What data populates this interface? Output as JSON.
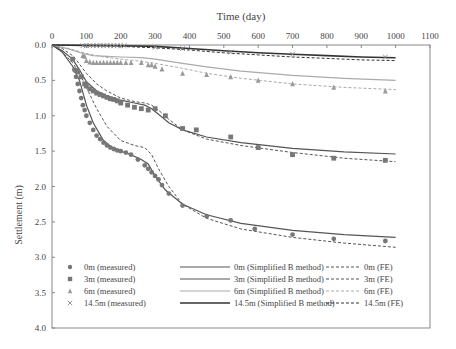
{
  "chart_data": {
    "type": "scatter",
    "title": "",
    "xlabel": "Time (day)",
    "ylabel": "Settlement (m)",
    "xlim": [
      0,
      1100
    ],
    "ylim": [
      0,
      4.0
    ],
    "y_inverted": true,
    "x_axis_position": "top",
    "xticks": [
      0,
      100,
      200,
      300,
      400,
      500,
      600,
      700,
      800,
      900,
      1000,
      1100
    ],
    "xtick_labels": [
      "0",
      "100",
      "200",
      "300",
      "400",
      "500",
      "600",
      "700",
      "800",
      "900",
      "1000",
      "1100"
    ],
    "yticks": [
      0,
      0.5,
      1.0,
      1.5,
      2.0,
      2.5,
      3.0,
      3.5,
      4.0
    ],
    "ytick_labels": [
      "0.0",
      "0.5",
      "1.0",
      "1.5",
      "2.0",
      "2.5",
      "3.0",
      "3.5",
      "4.0"
    ],
    "grid": false,
    "legend_position": "bottom",
    "series": [
      {
        "name": "0m (measured)",
        "kind": "marker",
        "marker": "circle",
        "color": "#777777",
        "x": [
          65,
          70,
          75,
          80,
          85,
          90,
          95,
          100,
          110,
          120,
          130,
          140,
          150,
          160,
          170,
          180,
          190,
          200,
          215,
          230,
          250,
          270,
          280,
          290,
          300,
          310,
          320,
          340,
          380,
          450,
          520,
          590,
          700,
          820,
          970
        ],
        "y": [
          0.35,
          0.45,
          0.55,
          0.65,
          0.75,
          0.85,
          0.92,
          1.0,
          1.1,
          1.2,
          1.28,
          1.33,
          1.38,
          1.42,
          1.45,
          1.47,
          1.49,
          1.5,
          1.52,
          1.55,
          1.62,
          1.7,
          1.75,
          1.8,
          1.85,
          1.9,
          1.98,
          2.1,
          2.27,
          2.42,
          2.48,
          2.6,
          2.68,
          2.74,
          2.77
        ]
      },
      {
        "name": "3m (measured)",
        "kind": "marker",
        "marker": "square",
        "color": "#777777",
        "x": [
          60,
          70,
          75,
          85,
          95,
          100,
          110,
          120,
          130,
          140,
          150,
          160,
          170,
          180,
          190,
          200,
          220,
          240,
          260,
          280,
          300,
          330,
          380,
          420,
          520,
          600,
          700,
          820,
          970
        ],
        "y": [
          0.2,
          0.36,
          0.38,
          0.45,
          0.55,
          0.58,
          0.62,
          0.65,
          0.68,
          0.7,
          0.72,
          0.74,
          0.76,
          0.77,
          0.79,
          0.82,
          0.85,
          0.88,
          0.9,
          0.92,
          0.9,
          1.0,
          1.18,
          1.2,
          1.3,
          1.45,
          1.55,
          1.6,
          1.63
        ]
      },
      {
        "name": "6m (measured)",
        "kind": "marker",
        "marker": "triangle",
        "color": "#999999",
        "x": [
          90,
          95,
          100,
          110,
          120,
          130,
          140,
          150,
          160,
          170,
          180,
          190,
          200,
          215,
          230,
          260,
          280,
          290,
          300,
          320,
          380,
          450,
          520,
          600,
          700,
          820,
          970
        ],
        "y": [
          0.15,
          0.16,
          0.22,
          0.24,
          0.25,
          0.25,
          0.25,
          0.25,
          0.25,
          0.25,
          0.25,
          0.25,
          0.25,
          0.25,
          0.25,
          0.25,
          0.28,
          0.28,
          0.3,
          0.34,
          0.4,
          0.42,
          0.45,
          0.5,
          0.55,
          0.6,
          0.65
        ]
      },
      {
        "name": "14.5m (measured)",
        "kind": "marker",
        "marker": "x",
        "color": "#888888",
        "x": [
          90,
          100,
          110,
          120,
          130,
          140,
          150,
          160,
          170,
          180,
          190,
          200,
          210,
          300,
          380,
          520,
          700,
          970
        ],
        "y": [
          0.01,
          0.01,
          0.01,
          0.01,
          0.01,
          0.01,
          0.01,
          0.01,
          0.01,
          0.01,
          0.01,
          0.01,
          0.01,
          0.03,
          0.05,
          0.1,
          0.13,
          0.17
        ]
      },
      {
        "name": "0m (Simplified B method)",
        "kind": "solid",
        "color": "#555555",
        "width": 1.2,
        "x": [
          0,
          30,
          60,
          80,
          100,
          120,
          150,
          180,
          200,
          230,
          260,
          280,
          300,
          330,
          380,
          450,
          550,
          700,
          850,
          1000
        ],
        "y": [
          0,
          0.1,
          0.3,
          0.5,
          0.85,
          1.1,
          1.35,
          1.47,
          1.5,
          1.55,
          1.62,
          1.68,
          1.85,
          2.05,
          2.25,
          2.4,
          2.52,
          2.62,
          2.68,
          2.72
        ]
      },
      {
        "name": "3m (Simplified B method)",
        "kind": "solid",
        "color": "#555555",
        "width": 1.2,
        "x": [
          0,
          30,
          60,
          80,
          100,
          130,
          160,
          200,
          240,
          270,
          290,
          310,
          340,
          380,
          450,
          550,
          700,
          850,
          1000
        ],
        "y": [
          0,
          0.08,
          0.2,
          0.35,
          0.52,
          0.65,
          0.72,
          0.78,
          0.82,
          0.85,
          0.9,
          0.98,
          1.1,
          1.2,
          1.3,
          1.38,
          1.46,
          1.51,
          1.54
        ]
      },
      {
        "name": "6m (Simplified B method)",
        "kind": "solid",
        "color": "#aaaaaa",
        "width": 1.2,
        "x": [
          0,
          50,
          90,
          120,
          160,
          200,
          260,
          300,
          380,
          450,
          550,
          700,
          850,
          1000
        ],
        "y": [
          0,
          0.06,
          0.12,
          0.15,
          0.16,
          0.17,
          0.18,
          0.2,
          0.26,
          0.31,
          0.37,
          0.43,
          0.47,
          0.5
        ]
      },
      {
        "name": "14.5m (Simplified B method)",
        "kind": "solid",
        "color": "#333333",
        "width": 1.6,
        "x": [
          0,
          100,
          200,
          300,
          400,
          500,
          600,
          700,
          800,
          900,
          1000
        ],
        "y": [
          0,
          0.005,
          0.01,
          0.02,
          0.05,
          0.08,
          0.11,
          0.13,
          0.15,
          0.17,
          0.18
        ]
      },
      {
        "name": "0m (FE)",
        "kind": "dashed",
        "color": "#555555",
        "width": 1,
        "x": [
          0,
          30,
          60,
          80,
          100,
          130,
          160,
          200,
          240,
          270,
          290,
          310,
          340,
          380,
          450,
          550,
          700,
          850,
          1000
        ],
        "y": [
          0,
          0.1,
          0.25,
          0.4,
          0.6,
          0.9,
          1.15,
          1.35,
          1.42,
          1.45,
          1.55,
          1.75,
          2.0,
          2.25,
          2.45,
          2.6,
          2.72,
          2.8,
          2.86
        ]
      },
      {
        "name": "3m (FE)",
        "kind": "dashed",
        "color": "#555555",
        "width": 1,
        "x": [
          0,
          30,
          60,
          80,
          100,
          130,
          160,
          200,
          240,
          270,
          290,
          310,
          340,
          380,
          450,
          550,
          700,
          850,
          1000
        ],
        "y": [
          0,
          0.05,
          0.15,
          0.27,
          0.4,
          0.55,
          0.65,
          0.75,
          0.8,
          0.82,
          0.85,
          0.92,
          1.05,
          1.2,
          1.33,
          1.42,
          1.52,
          1.6,
          1.65
        ]
      },
      {
        "name": "6m (FE)",
        "kind": "dashed",
        "color": "#aaaaaa",
        "width": 1,
        "x": [
          0,
          50,
          100,
          150,
          200,
          260,
          300,
          380,
          450,
          550,
          700,
          850,
          1000
        ],
        "y": [
          0,
          0.05,
          0.12,
          0.17,
          0.2,
          0.23,
          0.26,
          0.33,
          0.4,
          0.47,
          0.55,
          0.6,
          0.63
        ]
      },
      {
        "name": "14.5m (FE)",
        "kind": "dashed",
        "color": "#333333",
        "width": 1,
        "x": [
          0,
          100,
          200,
          300,
          400,
          500,
          600,
          700,
          800,
          900,
          1000
        ],
        "y": [
          0,
          0.01,
          0.02,
          0.04,
          0.07,
          0.11,
          0.14,
          0.17,
          0.19,
          0.21,
          0.22
        ]
      }
    ],
    "legend": {
      "columns": [
        [
          "0m (measured)",
          "3m (measured)",
          "6m (measured)",
          "14.5m (measured)"
        ],
        [
          "0m (Simplified B method)",
          "3m (Simplified B method)",
          "6m (Simplified B method)",
          "14.5m (Simplified B method)"
        ],
        [
          "0m (FE)",
          "3m (FE)",
          "6m (FE)",
          "14.5m (FE)"
        ]
      ]
    }
  }
}
